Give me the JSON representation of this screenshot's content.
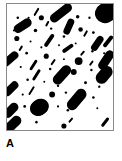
{
  "figure": {
    "panel_label": "A",
    "label_color": "#000000",
    "background_color": "#ffffff",
    "particle_color": "#000000",
    "border_color": "#8a8a8a",
    "panel": {
      "x": 6,
      "y": 3,
      "width": 108,
      "height": 128
    }
  },
  "chart_data": {
    "type": "scatter",
    "title": "A",
    "subtitle": "",
    "xlabel": "",
    "ylabel": "",
    "xlim": [
      0,
      108
    ],
    "ylim": [
      0,
      128
    ],
    "grid": false,
    "legend": null,
    "categories": [
      "rod",
      "dot",
      "blob"
    ],
    "values": [
      30,
      44,
      3
    ],
    "series": [
      {
        "name": "rod",
        "shape": "capsule",
        "count": 30,
        "items": [
          {
            "cx": 55,
            "cy": 9,
            "len": 26,
            "w": 9,
            "angle": -38
          },
          {
            "cx": 104,
            "cy": 7,
            "len": 30,
            "w": 20,
            "angle": -30
          },
          {
            "cx": 30,
            "cy": 8,
            "len": 9,
            "w": 2,
            "angle": -60
          },
          {
            "cx": 92,
            "cy": 8,
            "len": 8,
            "w": 2,
            "angle": -62
          },
          {
            "cx": 16,
            "cy": 22,
            "len": 20,
            "w": 9,
            "angle": -33
          },
          {
            "cx": 63,
            "cy": 23,
            "len": 17,
            "w": 7,
            "angle": -66
          },
          {
            "cx": 43,
            "cy": 37,
            "len": 15,
            "w": 4,
            "angle": -55
          },
          {
            "cx": 92,
            "cy": 40,
            "len": 17,
            "w": 7,
            "angle": -55
          },
          {
            "cx": 103,
            "cy": 38,
            "len": 14,
            "w": 4,
            "angle": -52
          },
          {
            "cx": 62,
            "cy": 45,
            "len": 13,
            "w": 4,
            "angle": -35
          },
          {
            "cx": 3,
            "cy": 56,
            "len": 20,
            "w": 8,
            "angle": -40
          },
          {
            "cx": 27,
            "cy": 62,
            "len": 12,
            "w": 3,
            "angle": -57
          },
          {
            "cx": 101,
            "cy": 57,
            "len": 22,
            "w": 9,
            "angle": -56
          },
          {
            "cx": 30,
            "cy": 72,
            "len": 13,
            "w": 3,
            "angle": -58
          },
          {
            "cx": 56,
            "cy": 72,
            "len": 23,
            "w": 10,
            "angle": -48
          },
          {
            "cx": 99,
            "cy": 72,
            "len": 20,
            "w": 12,
            "angle": -50
          },
          {
            "cx": 4,
            "cy": 86,
            "len": 18,
            "w": 8,
            "angle": -44
          },
          {
            "cx": 25,
            "cy": 88,
            "len": 10,
            "w": 2,
            "angle": -58
          },
          {
            "cx": 71,
            "cy": 97,
            "len": 25,
            "w": 11,
            "angle": -50
          },
          {
            "cx": 4,
            "cy": 108,
            "len": 18,
            "w": 9,
            "angle": -46
          },
          {
            "cx": 6,
            "cy": 122,
            "len": 20,
            "w": 10,
            "angle": -44
          },
          {
            "cx": 100,
            "cy": 120,
            "len": 11,
            "w": 3,
            "angle": -52
          },
          {
            "cx": 33,
            "cy": 105,
            "len": 19,
            "w": 16,
            "angle": -35
          },
          {
            "cx": 80,
            "cy": 30,
            "len": 7,
            "w": 2,
            "angle": -60
          },
          {
            "cx": 14,
            "cy": 45,
            "len": 6,
            "w": 2,
            "angle": -58
          },
          {
            "cx": 47,
            "cy": 59,
            "len": 7,
            "w": 2,
            "angle": -55
          },
          {
            "cx": 86,
            "cy": 60,
            "len": 6,
            "w": 2,
            "angle": -55
          },
          {
            "cx": 65,
            "cy": 118,
            "len": 6,
            "w": 2,
            "angle": -50
          },
          {
            "cx": 41,
            "cy": 20,
            "len": 6,
            "w": 2,
            "angle": -62
          },
          {
            "cx": 77,
            "cy": 50,
            "len": 6,
            "w": 2,
            "angle": -50
          }
        ]
      },
      {
        "name": "dot",
        "shape": "ellipse",
        "count": 44,
        "items": [
          {
            "cx": 11,
            "cy": 14,
            "r": 1.3
          },
          {
            "cx": 22,
            "cy": 14,
            "r": 1.1
          },
          {
            "cx": 35,
            "cy": 14,
            "r": 2.6
          },
          {
            "cx": 48,
            "cy": 15,
            "r": 1.5
          },
          {
            "cx": 72,
            "cy": 13,
            "r": 1.8
          },
          {
            "cx": 84,
            "cy": 14,
            "r": 1.2
          },
          {
            "cx": 97,
            "cy": 16,
            "r": 2.0
          },
          {
            "cx": 7,
            "cy": 27,
            "r": 1.0
          },
          {
            "cx": 29,
            "cy": 27,
            "r": 1.8
          },
          {
            "cx": 45,
            "cy": 25,
            "r": 1.2
          },
          {
            "cx": 58,
            "cy": 33,
            "r": 1.3
          },
          {
            "cx": 75,
            "cy": 26,
            "r": 2.3
          },
          {
            "cx": 88,
            "cy": 29,
            "r": 1.4
          },
          {
            "cx": 10,
            "cy": 35,
            "r": 2.6
          },
          {
            "cx": 24,
            "cy": 38,
            "r": 1.0
          },
          {
            "cx": 35,
            "cy": 44,
            "r": 1.1
          },
          {
            "cx": 53,
            "cy": 42,
            "r": 1.0
          },
          {
            "cx": 70,
            "cy": 40,
            "r": 1.0
          },
          {
            "cx": 87,
            "cy": 48,
            "r": 1.2
          },
          {
            "cx": 20,
            "cy": 50,
            "r": 1.4
          },
          {
            "cx": 40,
            "cy": 53,
            "r": 2.6
          },
          {
            "cx": 58,
            "cy": 56,
            "r": 1.0
          },
          {
            "cx": 73,
            "cy": 58,
            "r": 2.8
          },
          {
            "cx": 99,
            "cy": 50,
            "r": 1.1
          },
          {
            "cx": 14,
            "cy": 64,
            "r": 1.1
          },
          {
            "cx": 44,
            "cy": 66,
            "r": 1.3
          },
          {
            "cx": 68,
            "cy": 69,
            "r": 3.0
          },
          {
            "cx": 86,
            "cy": 67,
            "r": 1.2
          },
          {
            "cx": 99,
            "cy": 64,
            "r": 1.2
          },
          {
            "cx": 21,
            "cy": 77,
            "r": 1.3
          },
          {
            "cx": 38,
            "cy": 79,
            "r": 1.0
          },
          {
            "cx": 52,
            "cy": 83,
            "r": 1.2
          },
          {
            "cx": 80,
            "cy": 80,
            "r": 1.5
          },
          {
            "cx": 94,
            "cy": 84,
            "r": 1.2
          },
          {
            "cx": 16,
            "cy": 92,
            "r": 1.1
          },
          {
            "cx": 46,
            "cy": 92,
            "r": 3.0
          },
          {
            "cx": 60,
            "cy": 90,
            "r": 1.2
          },
          {
            "cx": 88,
            "cy": 95,
            "r": 1.3
          },
          {
            "cx": 18,
            "cy": 104,
            "r": 1.4
          },
          {
            "cx": 52,
            "cy": 104,
            "r": 1.1
          },
          {
            "cx": 62,
            "cy": 108,
            "r": 1.3
          },
          {
            "cx": 92,
            "cy": 106,
            "r": 1.0
          },
          {
            "cx": 30,
            "cy": 120,
            "r": 1.3
          },
          {
            "cx": 58,
            "cy": 124,
            "r": 2.6
          }
        ]
      },
      {
        "name": "blob",
        "shape": "ellipse",
        "count": 3,
        "items": [
          {
            "cx": 33,
            "cy": 105,
            "rx": 10,
            "ry": 8,
            "angle": -25
          },
          {
            "cx": 104,
            "cy": 5,
            "rx": 12,
            "ry": 9,
            "angle": -35
          },
          {
            "cx": 73,
            "cy": 58,
            "rx": 4,
            "ry": 4,
            "angle": 0
          }
        ]
      }
    ]
  }
}
